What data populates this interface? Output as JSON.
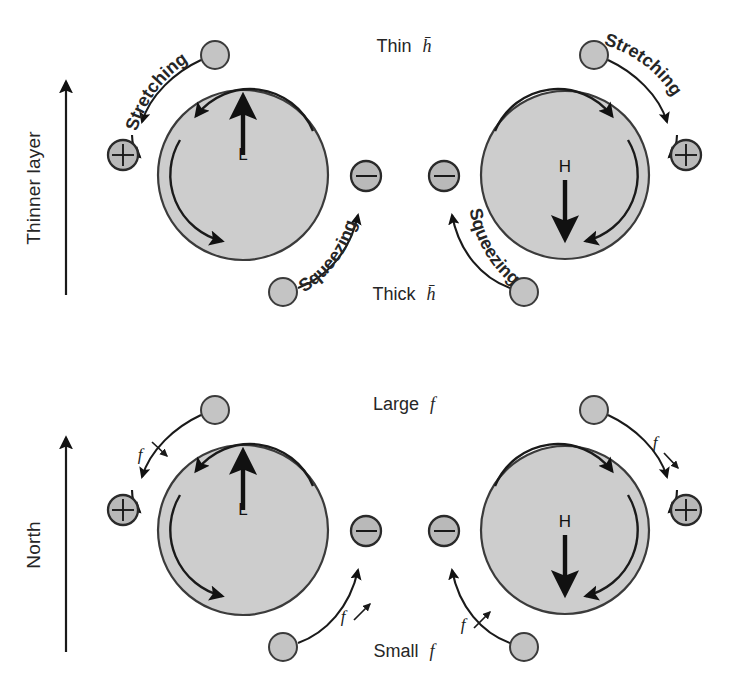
{
  "figure": {
    "background": "#ffffff",
    "disk_fill": "#cdcdcd",
    "disk_stroke": "#3b3b3b",
    "parcel_fill": "#c4c4c4",
    "parcel_stroke": "#3b3b3b",
    "arrow_color": "#111111"
  },
  "panels": [
    {
      "id": "top-left",
      "row": "top",
      "column": "left",
      "center_label": "L",
      "center_arrow": "up",
      "circulation": "counterclockwise",
      "incoming_parcel_label": "Stretching",
      "incoming_parcel_sign": "+",
      "outgoing_parcel_label": "Squeezing",
      "outgoing_parcel_sign": "−"
    },
    {
      "id": "top-right",
      "row": "top",
      "column": "right",
      "center_label": "H",
      "center_arrow": "down",
      "circulation": "clockwise",
      "incoming_parcel_label": "Stretching",
      "incoming_parcel_sign": "+",
      "outgoing_parcel_label": "Squeezing",
      "outgoing_parcel_sign": "−"
    },
    {
      "id": "bottom-left",
      "row": "bottom",
      "column": "left",
      "center_label": "L",
      "center_arrow": "up",
      "circulation": "counterclockwise",
      "incoming_parcel_label": "f",
      "incoming_parcel_sign": "+",
      "outgoing_parcel_label": "f",
      "outgoing_parcel_sign": "−"
    },
    {
      "id": "bottom-right",
      "row": "bottom",
      "column": "right",
      "center_label": "H",
      "center_arrow": "down",
      "circulation": "clockwise",
      "incoming_parcel_label": "f",
      "incoming_parcel_sign": "+",
      "outgoing_parcel_label": "f",
      "outgoing_parcel_sign": "−"
    }
  ],
  "axes": [
    {
      "id": "top-axis",
      "label": "Thinner layer",
      "direction": "up"
    },
    {
      "id": "bottom-axis",
      "label": "North",
      "direction": "up"
    }
  ],
  "annotations": {
    "top_top_label": {
      "text": "Thin",
      "symbol": "h̄"
    },
    "top_bottom_label": {
      "text": "Thick",
      "symbol": "h̄"
    },
    "bottom_top_label": {
      "text": "Large",
      "symbol": "f"
    },
    "bottom_bottom_label": {
      "text": "Small",
      "symbol": "f"
    }
  },
  "labels": {
    "stretching": "Stretching",
    "squeezing": "Squeezing",
    "low": "L",
    "high": "H",
    "plus": "+",
    "minus": "−",
    "f": "f",
    "thinner_layer": "Thinner layer",
    "north": "North",
    "thin": "Thin",
    "thick": "Thick",
    "large": "Large",
    "small": "Small",
    "h_bar": "h̄"
  }
}
